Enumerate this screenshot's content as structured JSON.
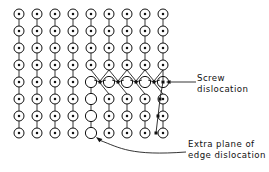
{
  "figure": {
    "background_color": "#ffffff",
    "line_color": "#111111",
    "atom_fill": "#ffffff",
    "atom_stroke": "#111111",
    "marker_fill": "#111111",
    "width": 269,
    "height": 172
  },
  "labels": {
    "screw": {
      "line1": "Screw",
      "line2": "dislocation"
    },
    "edge": {
      "line1": "Extra plane of",
      "line2": "edge dislocation"
    }
  },
  "lattice": {
    "columns": 9,
    "rows": 8,
    "column_x": [
      19,
      37,
      55,
      73,
      91,
      109,
      127,
      145,
      163
    ],
    "row_y": [
      14,
      31,
      48,
      65,
      82,
      99,
      116,
      133
    ],
    "atom_radius": 5.0,
    "atom_inner_radius": 1.25,
    "open_atom_radius": 5.6,
    "square_size": 3.0,
    "atom_types": [
      [
        "dot",
        "dot",
        "dot",
        "dot",
        "dot",
        "dot",
        "dot",
        "dot",
        "dot"
      ],
      [
        "dot",
        "dot",
        "dot",
        "dot",
        "dot",
        "dot",
        "dot",
        "dot",
        "dot"
      ],
      [
        "dot",
        "dot",
        "dot",
        "dot",
        "dot",
        "dot",
        "dot",
        "dot",
        "dot"
      ],
      [
        "dot",
        "dot",
        "dot",
        "dot",
        "dot",
        "dot",
        "dot",
        "dot",
        "dot"
      ],
      [
        "dot",
        "dot",
        "dot",
        "dot",
        "open",
        "open",
        "open",
        "open",
        "open"
      ],
      [
        "dot",
        "dot",
        "dot",
        "dot",
        "open",
        "dot",
        "dot",
        "dot",
        "dot"
      ],
      [
        "dot",
        "dot",
        "dot",
        "dot",
        "open",
        "dot",
        "dot",
        "dot",
        "dot"
      ],
      [
        "dot",
        "dot",
        "dot",
        "dot",
        "open",
        "dot",
        "dot",
        "dot",
        "dot"
      ]
    ],
    "screw_row_index": 4,
    "screw_markers_x": [
      100,
      118,
      136,
      154
    ],
    "screw_marker_y": 82,
    "right_column_markers": [
      {
        "x": 163,
        "y": 82
      },
      {
        "x": 160,
        "y": 99
      },
      {
        "x": 158,
        "y": 116
      },
      {
        "x": 156,
        "y": 133
      }
    ],
    "extra_plane_column_index": 4
  },
  "annotations": {
    "screw_arrow": {
      "from_x": 196,
      "from_y": 82,
      "to_x": 166,
      "to_y": 82,
      "type": "straight-arrow"
    },
    "edge_arrow": {
      "from_x": 186,
      "from_y": 152,
      "to_x": 96,
      "to_y": 137,
      "type": "curved-arrow"
    }
  }
}
